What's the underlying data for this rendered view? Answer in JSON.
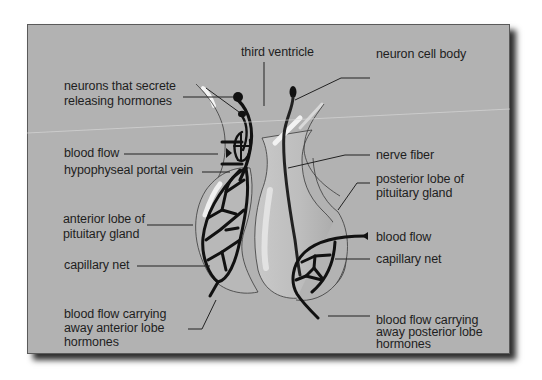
{
  "diagram": {
    "type": "anatomy",
    "colors": {
      "panel_background": "#b2b2b2",
      "panel_border": "#5a5a5a",
      "shadow": "#2e2e2e",
      "vessel": "#111111",
      "text": "#1e1e1e"
    },
    "labels": {
      "third_ventricle": "third ventricle",
      "neuron_cell_body": "neuron cell body",
      "neurons_secrete_line1": "neurons that secrete",
      "neurons_secrete_line2": "releasing hormones",
      "blood_flow_left": "blood flow",
      "hypophyseal_portal_vein": "hypophyseal portal vein",
      "nerve_fiber": "nerve fiber",
      "posterior_lobe_line1": "posterior lobe of",
      "posterior_lobe_line2": "pituitary gland",
      "anterior_lobe_line1": "anterior lobe of",
      "anterior_lobe_line2": "pituitary gland",
      "blood_flow_right": "blood flow",
      "capillary_net_left": "capillary net",
      "capillary_net_right": "capillary net",
      "blood_away_anterior_line1": "blood flow carrying",
      "blood_away_anterior_line2": "away anterior lobe",
      "blood_away_anterior_line3": "hormones",
      "blood_away_posterior_line1": "blood flow carrying",
      "blood_away_posterior_line2": "away posterior lobe",
      "blood_away_posterior_line3": "hormones"
    }
  }
}
